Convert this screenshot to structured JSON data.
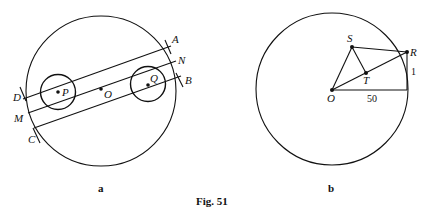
{
  "figure": {
    "caption": "Fig. 51",
    "panels": [
      {
        "id": "a",
        "label": "a",
        "points": {
          "A": "A",
          "N": "N",
          "B": "B",
          "D": "D",
          "M": "M",
          "C": "C",
          "P": "P",
          "O": "O",
          "Q": "Q"
        }
      },
      {
        "id": "b",
        "label": "b",
        "points": {
          "S": "S",
          "R": "R",
          "T": "T",
          "O": "O"
        },
        "measures": {
          "horizontal": "50",
          "vertical": "1"
        }
      }
    ]
  }
}
